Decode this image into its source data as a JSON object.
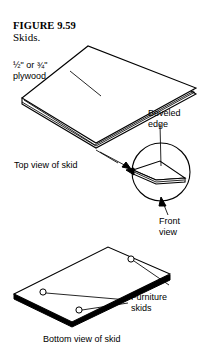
{
  "figure": {
    "number": "FIGURE 9.59",
    "caption": "Skids."
  },
  "labels": {
    "plywood": "½\" or ¾\"\nplywood",
    "top_view": "Top view of skid",
    "beveled_edge": "Beveled\nedge",
    "front_view": "Front\nview",
    "furniture_skids": "Furniture\nskids",
    "bottom_view": "Bottom view of skid"
  },
  "colors": {
    "ink": "#000000",
    "paper": "#ffffff"
  },
  "diagram": {
    "type": "technical-woodworking-illustration",
    "views": [
      {
        "name": "top-view-of-skid",
        "shape": "parallelogram-with-thickness",
        "description": "Plywood skid panel shown in isometric top view with visible edge thickness along the near side."
      },
      {
        "name": "beveled-edge-detail",
        "shape": "circular-magnified-callout",
        "description": "Enlarged circular detail showing the chamfered bevel on the panel edge."
      },
      {
        "name": "bottom-view-of-skid",
        "shape": "parallelogram-with-thickness",
        "description": "Underside of the skid panel showing three round furniture skid glides.",
        "furniture_skid_count": 3
      }
    ]
  }
}
